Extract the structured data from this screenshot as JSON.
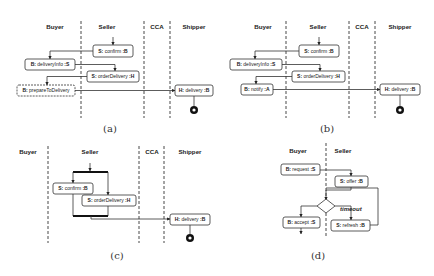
{
  "panels": {
    "a": {
      "caption": "(a)",
      "lanes": [
        "Buyer",
        "Seller",
        "CCA",
        "Shipper"
      ],
      "nodes": [
        {
          "id": "a1",
          "prefix": "S:",
          "action": "confirm",
          "target": ":B"
        },
        {
          "id": "a2",
          "prefix": "B:",
          "action": "deliveryInfo",
          "target": ":S"
        },
        {
          "id": "a3",
          "prefix": "S:",
          "action": "orderDelivery",
          "target": ":H"
        },
        {
          "id": "a4",
          "prefix": "B:",
          "action": "prepareToDelivery",
          "target": ""
        },
        {
          "id": "a5",
          "prefix": "H:",
          "action": "delivery",
          "target": ":B"
        }
      ]
    },
    "b": {
      "caption": "(b)",
      "lanes": [
        "Buyer",
        "Seller",
        "CCA",
        "Shipper"
      ],
      "nodes": [
        {
          "id": "b1",
          "prefix": "S:",
          "action": "confirm",
          "target": ":B"
        },
        {
          "id": "b2",
          "prefix": "B:",
          "action": "deliveryInfo",
          "target": ":S"
        },
        {
          "id": "b3",
          "prefix": "S:",
          "action": "orderDelivery",
          "target": ":H"
        },
        {
          "id": "b4",
          "prefix": "B:",
          "action": "notify",
          "target": ":A"
        },
        {
          "id": "b5",
          "prefix": "H:",
          "action": "delivery",
          "target": ":B"
        }
      ]
    },
    "c": {
      "caption": "(c)",
      "lanes": [
        "Buyer",
        "Seller",
        "CCA",
        "Shipper"
      ],
      "nodes": [
        {
          "id": "c1",
          "prefix": "S:",
          "action": "confirm",
          "target": ":B"
        },
        {
          "id": "c2",
          "prefix": "S:",
          "action": "orderDelivery",
          "target": ":H"
        },
        {
          "id": "c3",
          "prefix": "H:",
          "action": "delivery",
          "target": ":B"
        }
      ]
    },
    "d": {
      "caption": "(d)",
      "lanes": [
        "Buyer",
        "Seller"
      ],
      "guard": "timeout",
      "nodes": [
        {
          "id": "d1",
          "prefix": "B:",
          "action": "request",
          "target": ":S"
        },
        {
          "id": "d2",
          "prefix": "S:",
          "action": "offer",
          "target": ":B"
        },
        {
          "id": "d3",
          "prefix": "B:",
          "action": "accept",
          "target": ":S"
        },
        {
          "id": "d4",
          "prefix": "S:",
          "action": "refresh",
          "target": ":B"
        }
      ]
    }
  }
}
